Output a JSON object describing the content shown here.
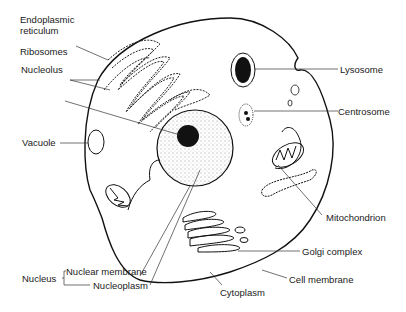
{
  "colors": {
    "line": "#111111",
    "label": "#1a1a1a",
    "background": "#ffffff"
  },
  "labels": {
    "endoplasmic_reticulum_1": "Endoplasmic",
    "endoplasmic_reticulum_2": "reticulum",
    "ribosomes": "Ribosomes",
    "nucleolus": "Nucleolus",
    "vacuole": "Vacuole",
    "lysosome": "Lysosome",
    "centrosome": "Centrosome",
    "mitochondrion": "Mitochondrion",
    "golgi_complex": "Golgi complex",
    "cell_membrane": "Cell membrane",
    "cytoplasm": "Cytoplasm",
    "nucleus": "Nucleus",
    "nuclear_membrane": "Nuclear membrane",
    "nucleoplasm": "Nucleoplasm"
  }
}
